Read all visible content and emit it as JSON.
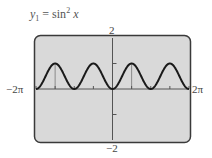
{
  "figure": {
    "equation": {
      "lhs_var": "y",
      "lhs_sub": "1",
      "equals": "=",
      "func": "sin",
      "power": "2",
      "arg": "x"
    },
    "labels": {
      "ymax": "2",
      "ymin": "−2",
      "xmin": "−2π",
      "xmax": "2π"
    },
    "colors": {
      "screen_fill": "#d9d9d9",
      "screen_border": "#3a3a3a",
      "curve": "#1a1a1a",
      "axis": "#555555"
    }
  },
  "chart_data": {
    "type": "line",
    "xlabel": "",
    "ylabel": "",
    "xlim": [
      -6.2832,
      6.2832
    ],
    "ylim": [
      -2,
      2
    ],
    "x_tick_labels": [
      "−2π",
      "2π"
    ],
    "y_tick_labels": [
      "−2",
      "2"
    ],
    "x_ticks_every": "π/2",
    "y_ticks": [
      -1,
      1
    ],
    "grid": false,
    "legend": null,
    "series": [
      {
        "name": "y1 = sin^2 x",
        "function": "sin(x)^2",
        "x": [
          -6.2832,
          -5.4978,
          -4.7124,
          -3.927,
          -3.1416,
          -2.3562,
          -1.5708,
          -0.7854,
          0,
          0.7854,
          1.5708,
          2.3562,
          3.1416,
          3.927,
          4.7124,
          5.4978,
          6.2832
        ],
        "values": [
          0,
          0.5,
          1,
          0.5,
          0,
          0.5,
          1,
          0.5,
          0,
          0.5,
          1,
          0.5,
          0,
          0.5,
          1,
          0.5,
          0
        ]
      }
    ]
  }
}
